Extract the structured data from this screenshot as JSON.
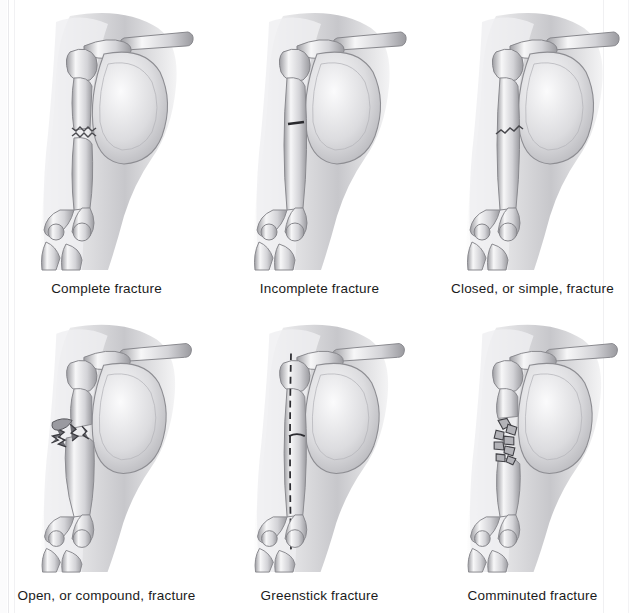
{
  "figure": {
    "background_color": "#ffffff",
    "ink_color": "#1b1b1b",
    "style": "grayscale pencil / airbrush medical illustration",
    "layout": {
      "columns": 3,
      "rows": 2,
      "panel_count": 6
    }
  },
  "anatomy": {
    "bones_shown": [
      "clavicle",
      "scapula",
      "humerus",
      "radius",
      "ulna"
    ],
    "view": "anterior right upper limb with soft-tissue silhouette"
  },
  "panels": [
    {
      "id": "complete-fracture",
      "label": "Complete fracture",
      "break_style": "jagged transverse break through entire humeral shaft with displacement",
      "break_y_fraction": 0.53,
      "row": 1,
      "column": 1
    },
    {
      "id": "incomplete-fracture",
      "label": "Incomplete fracture",
      "break_style": "short horizontal crack crossing only part of the shaft",
      "break_y_fraction": 0.45,
      "row": 1,
      "column": 2
    },
    {
      "id": "closed-simple-fracture",
      "label": "Closed, or simple, fracture",
      "break_style": "oblique jagged break with intact overlying skin",
      "break_y_fraction": 0.46,
      "row": 1,
      "column": 3
    },
    {
      "id": "open-compound-fracture",
      "label": "Open, or compound, fracture",
      "break_style": "displaced break with bone fragments piercing the skin",
      "break_y_fraction": 0.4,
      "row": 2,
      "column": 1
    },
    {
      "id": "greenstick-fracture",
      "label": "Greenstick fracture",
      "break_style": "long dashed longitudinal split with a partial transverse bend",
      "break_y_fraction": 0.46,
      "row": 2,
      "column": 2
    },
    {
      "id": "comminuted-fracture",
      "label": "Comminuted fracture",
      "break_style": "shaft shattered into many small bone fragments",
      "break_y_fraction": 0.42,
      "row": 2,
      "column": 3
    }
  ]
}
